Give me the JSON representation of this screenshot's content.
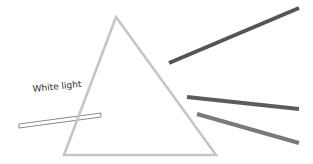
{
  "diagram": {
    "label": "White light",
    "colors": {
      "prism_stroke": "#c6c6c6",
      "beam_outline": "#8a8a8a",
      "beam_fill": "#ffffff",
      "ray_top": "#555555",
      "ray_middle": "#5c5c5c",
      "ray_bottom": "#7a7a7a",
      "label_text": "#333333"
    },
    "prism": {
      "apex": [
        116,
        17
      ],
      "base_left": [
        64,
        155
      ],
      "base_right": [
        216,
        155
      ]
    },
    "incoming_beam": {
      "from": [
        20,
        126
      ],
      "to": [
        101,
        115
      ]
    },
    "rays": [
      {
        "name": "ray-top",
        "from": [
          169,
          63
        ],
        "to": [
          299,
          8
        ]
      },
      {
        "name": "ray-middle",
        "from": [
          187,
          97
        ],
        "to": [
          299,
          109
        ]
      },
      {
        "name": "ray-bottom",
        "from": [
          197,
          114
        ],
        "to": [
          299,
          143
        ]
      }
    ]
  }
}
